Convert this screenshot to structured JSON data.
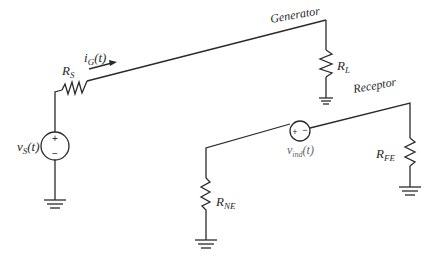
{
  "diagram": {
    "type": "circuit-schematic",
    "labels": {
      "generator": "Generator",
      "receptor": "Receptor",
      "source_voltage": {
        "main": "v",
        "sub": "S",
        "arg": "(t)"
      },
      "source_resistor": {
        "main": "R",
        "sub": "S"
      },
      "current": {
        "main": "i",
        "sub": "G",
        "arg": "(t)"
      },
      "load_resistor": {
        "main": "R",
        "sub": "L"
      },
      "induced_voltage": {
        "main": "v",
        "sub": "ind",
        "arg": "(t)"
      },
      "near_end_resistor": {
        "main": "R",
        "sub": "NE"
      },
      "far_end_resistor": {
        "main": "R",
        "sub": "FE"
      },
      "plus": "+",
      "minus": "−"
    },
    "circuits": [
      {
        "name": "Generator",
        "components": [
          "v_S(t)",
          "R_S",
          "R_L",
          "ground",
          "ground"
        ]
      },
      {
        "name": "Receptor",
        "components": [
          "R_NE",
          "v_ind(t)",
          "R_FE",
          "ground",
          "ground"
        ]
      }
    ],
    "colors": {
      "wire": "#2a2a2a",
      "induced_label": "#666666",
      "background": "#ffffff"
    }
  }
}
